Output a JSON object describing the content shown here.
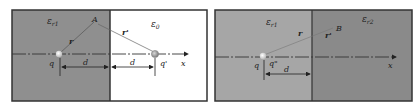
{
  "panels": [
    {
      "id": "left",
      "region_left": {
        "label": "ε",
        "sub": "r1",
        "color": "#8f8f8f"
      },
      "region_right": {
        "label": "ε",
        "sub": "0",
        "color": "#ffffff"
      },
      "charge_q": "q",
      "charge_image": "q'",
      "point": "A",
      "r_label": "r",
      "r_prime_label": "r'",
      "d_label_1": "d",
      "d_label_2": "d",
      "axis_label": "x"
    },
    {
      "id": "right",
      "region_left": {
        "label": "ε",
        "sub": "r1",
        "color": "#a6a6a6"
      },
      "region_right": {
        "label": "ε",
        "sub": "r2",
        "color": "#8a8a8a"
      },
      "charge_q": "q",
      "charge_image": "q\"",
      "point": "B",
      "r_label": "r",
      "r_prime_label": "r'",
      "d_label": "d",
      "axis_label": "x"
    }
  ]
}
